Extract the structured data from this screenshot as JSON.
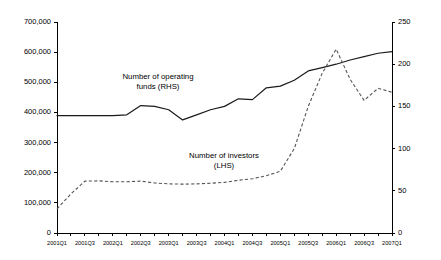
{
  "chart_data": {
    "type": "line",
    "title": "",
    "xlabel": "",
    "ylabel": "",
    "grid": false,
    "legend_position": "inline-annotations",
    "x": [
      "2001Q1",
      "2001Q2",
      "2001Q3",
      "2001Q4",
      "2002Q1",
      "2002Q2",
      "2002Q3",
      "2002Q4",
      "2003Q1",
      "2003Q2",
      "2003Q3",
      "2003Q4",
      "2004Q1",
      "2004Q2",
      "2004Q3",
      "2004Q4",
      "2005Q1",
      "2005Q2",
      "2005Q3",
      "2005Q4",
      "2006Q1",
      "2006Q2",
      "2006Q3",
      "2006Q4",
      "2007Q1"
    ],
    "x_tick_labels": [
      "2001Q1",
      "2001Q3",
      "2002Q1",
      "2002Q3",
      "2003Q1",
      "2003Q3",
      "2004Q1",
      "2004Q3",
      "2005Q1",
      "2005Q3",
      "2006Q1",
      "2006Q3",
      "2007Q1"
    ],
    "axes": {
      "left": {
        "label": "Number of investors (LHS)",
        "min": 0,
        "max": 700000,
        "step": 100000,
        "tick_labels": [
          "0",
          "100,000",
          "200,000",
          "300,000",
          "400,000",
          "500,000",
          "600,000",
          "700,000"
        ]
      },
      "right": {
        "label": "Number of operating funds (RHS)",
        "min": 0,
        "max": 250,
        "step": 50,
        "tick_labels": [
          "0",
          "50",
          "100",
          "150",
          "200",
          "250"
        ]
      }
    },
    "series": [
      {
        "name": "Number of operating funds (RHS)",
        "axis": "right",
        "style": "solid",
        "color": "#1a1a1a",
        "values": [
          139,
          139,
          139,
          139,
          139,
          140,
          151,
          150,
          146,
          134,
          140,
          146,
          150,
          159,
          158,
          172,
          174,
          181,
          192,
          196,
          200,
          205,
          209,
          213,
          215
        ]
      },
      {
        "name": "Number of investors (LHS)",
        "axis": "left",
        "style": "dashed",
        "color": "#555555",
        "values": [
          80000,
          130000,
          172000,
          173000,
          170000,
          170000,
          172000,
          166000,
          163000,
          162000,
          163000,
          165000,
          168000,
          175000,
          180000,
          190000,
          205000,
          280000,
          420000,
          530000,
          610000,
          510000,
          440000,
          480000,
          467000
        ]
      }
    ],
    "annotations": [
      {
        "text_line1": "Number of operating",
        "text_line2": "funds (RHS)",
        "x": 158,
        "y": 79
      },
      {
        "text_line1": "Number of investors",
        "text_line2": "(LHS)",
        "x": 224,
        "y": 158
      }
    ]
  }
}
